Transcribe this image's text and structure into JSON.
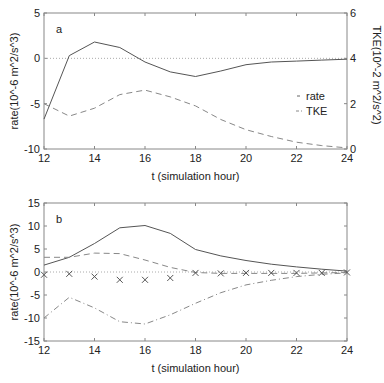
{
  "chart_data": [
    {
      "type": "line",
      "panel_label": "a",
      "xlabel": "t (simulation hour)",
      "ylabel": "rate(10^-6 m^2/s^3)",
      "ylabel_right": "TKE(10^-2 m^2/s^2)",
      "xlim": [
        12,
        24
      ],
      "ylim": [
        -10,
        5
      ],
      "ylim_right": [
        0,
        6
      ],
      "x_ticks": [
        "12",
        "14",
        "16",
        "18",
        "20",
        "22",
        "24"
      ],
      "y_ticks": [
        "5",
        "0",
        "-5",
        "-10"
      ],
      "y_ticks_right": [
        "6",
        "4",
        "2",
        "0"
      ],
      "zero_line": true,
      "legend": [
        "rate",
        "TKE"
      ],
      "legend_position": "right-middle",
      "x": [
        12,
        13,
        14,
        15,
        16,
        17,
        18,
        19,
        20,
        21,
        22,
        23,
        24
      ],
      "series": [
        {
          "name": "rate",
          "axis": "left",
          "style": "solid",
          "values": [
            -6.7,
            0.3,
            1.8,
            1.2,
            -0.4,
            -1.5,
            -2.0,
            -1.4,
            -0.7,
            -0.4,
            -0.3,
            -0.2,
            -0.1
          ]
        },
        {
          "name": "TKE",
          "axis": "right",
          "style": "dashed",
          "values": [
            2.0,
            1.45,
            1.8,
            2.4,
            2.6,
            2.3,
            1.9,
            1.3,
            0.85,
            0.55,
            0.3,
            0.15,
            0.05
          ]
        }
      ]
    },
    {
      "type": "line",
      "panel_label": "b",
      "xlabel": "t (simulation hour)",
      "ylabel": "rate(10^-6 m^2/s^3)",
      "xlim": [
        12,
        24
      ],
      "ylim": [
        -15,
        15
      ],
      "x_ticks": [
        "12",
        "14",
        "16",
        "18",
        "20",
        "22",
        "24"
      ],
      "y_ticks": [
        "15",
        "10",
        "5",
        "0",
        "-5",
        "-10",
        "-15"
      ],
      "zero_line": true,
      "x": [
        12,
        13,
        14,
        15,
        16,
        17,
        18,
        19,
        20,
        21,
        22,
        23,
        24
      ],
      "series": [
        {
          "name": "solid",
          "style": "solid",
          "values": [
            1.5,
            3.2,
            6.2,
            9.6,
            10.1,
            8.4,
            4.9,
            3.5,
            2.5,
            1.7,
            1.1,
            0.6,
            0.2
          ]
        },
        {
          "name": "dashed-upper",
          "style": "dashed",
          "values": [
            3.2,
            3.2,
            4.1,
            4.0,
            2.6,
            1.0,
            -0.1,
            -0.3,
            -0.3,
            -0.3,
            -0.3,
            -0.2,
            -0.1
          ]
        },
        {
          "name": "dashdot-lower",
          "style": "dashdot",
          "values": [
            -10.0,
            -5.5,
            -7.8,
            -10.8,
            -11.3,
            -9.3,
            -6.8,
            -4.5,
            -2.8,
            -1.8,
            -1.0,
            -0.5,
            -0.2
          ]
        },
        {
          "name": "x-markers",
          "style": "marker-x",
          "values": [
            -0.6,
            -0.4,
            -1.0,
            -1.7,
            -1.7,
            -1.3,
            -0.2,
            -0.3,
            -0.2,
            -0.2,
            -0.2,
            -0.2,
            -0.1
          ]
        }
      ]
    }
  ]
}
